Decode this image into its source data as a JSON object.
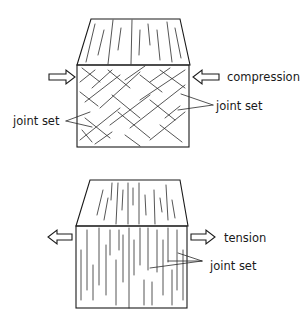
{
  "diagram": {
    "panels": [
      {
        "id": "compression",
        "load_label": "compression",
        "joint_labels": [
          "joint set",
          "joint set"
        ],
        "joint_pattern": "conjugate crossing (X-shaped) fractures"
      },
      {
        "id": "tension",
        "load_label": "tension",
        "joint_labels": [
          "joint set"
        ],
        "joint_pattern": "parallel vertical fractures"
      }
    ],
    "colors": {
      "line": "#1a1a1a",
      "background": "#ffffff"
    }
  }
}
